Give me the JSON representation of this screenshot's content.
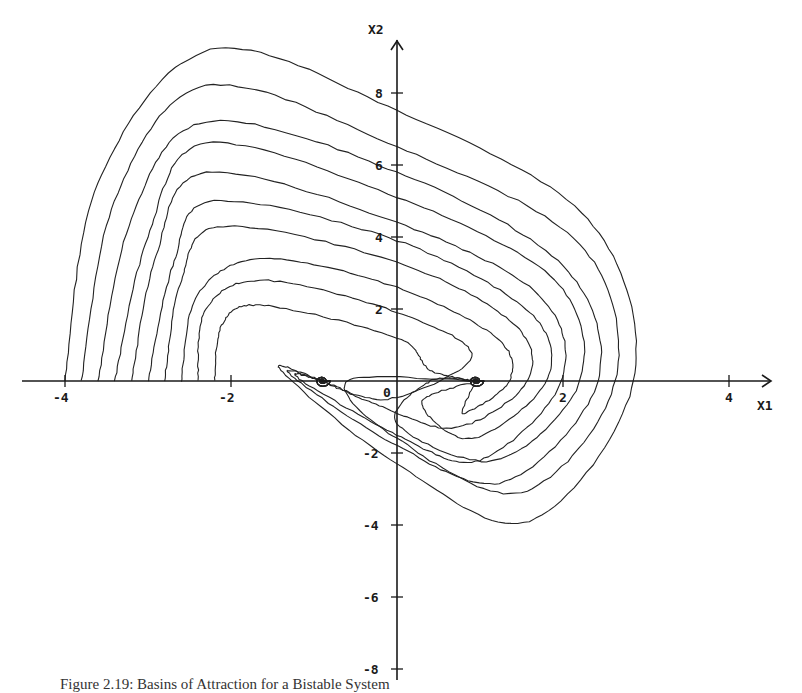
{
  "chart_data": {
    "type": "line",
    "subtype": "phase-portrait",
    "title": "",
    "xlabel": "X1",
    "ylabel": "X2",
    "xlim": [
      -4.8,
      4.6
    ],
    "ylim": [
      -8.3,
      9.6
    ],
    "grid": false,
    "legend": null,
    "x_ticks": [
      -4,
      -2,
      0,
      2,
      4
    ],
    "x_tick_labels": [
      "-4",
      "-2",
      "0",
      "2",
      "4"
    ],
    "y_ticks": [
      -8,
      -6,
      -4,
      -2,
      2,
      4,
      6,
      8
    ],
    "y_tick_labels": [
      "-8",
      "-6",
      "-4",
      "-2",
      "2",
      "4",
      "6",
      "8"
    ],
    "equilibria": [
      {
        "x1": -0.9,
        "x2": 0.0,
        "type": "stable focus"
      },
      {
        "x1": 0.95,
        "x2": 0.0,
        "type": "stable focus"
      }
    ],
    "series": [
      {
        "name": "trajectory 1",
        "x0": -4.0,
        "x2_0": 0.0,
        "points": [
          [
            -4.0,
            0
          ],
          [
            -3.6,
            5.5
          ],
          [
            -2.25,
            9.2
          ],
          [
            0,
            7.5
          ],
          [
            2.3,
            4.5
          ],
          [
            2.85,
            0
          ],
          [
            1.6,
            -3.9
          ],
          [
            0,
            -2.3
          ],
          [
            -1.4,
            0.3
          ],
          [
            -0.9,
            0
          ]
        ]
      },
      {
        "name": "trajectory 2",
        "x0": -3.8,
        "x2_0": 0.0,
        "points": [
          [
            -3.8,
            0
          ],
          [
            -3.4,
            5
          ],
          [
            -2.3,
            8.2
          ],
          [
            0,
            6.5
          ],
          [
            2.2,
            3.8
          ],
          [
            2.63,
            0
          ],
          [
            1.5,
            -3.1
          ],
          [
            0,
            -1.6
          ],
          [
            -0.6,
            0
          ],
          [
            0.95,
            0
          ]
        ]
      },
      {
        "name": "trajectory 3",
        "x0": -3.6,
        "x2_0": 0.0,
        "points": [
          [
            -3.6,
            0
          ],
          [
            -3.2,
            4.5
          ],
          [
            -2.3,
            7.2
          ],
          [
            0,
            5.8
          ],
          [
            2.0,
            3.2
          ],
          [
            2.42,
            0
          ],
          [
            1.3,
            -2.8
          ],
          [
            0,
            -1.8
          ],
          [
            -1.3,
            0.2
          ],
          [
            -0.9,
            0
          ]
        ]
      },
      {
        "name": "trajectory 4",
        "x0": -3.4,
        "x2_0": 0.0,
        "points": [
          [
            -3.4,
            0
          ],
          [
            -3.0,
            4
          ],
          [
            -2.3,
            6.6
          ],
          [
            0,
            5.1
          ],
          [
            1.9,
            2.8
          ],
          [
            2.2,
            0
          ],
          [
            1.2,
            -2.2
          ],
          [
            0,
            -1.2
          ],
          [
            0.4,
            0
          ],
          [
            0.95,
            0
          ]
        ]
      },
      {
        "name": "trajectory 5",
        "x0": -3.2,
        "x2_0": 0.0,
        "points": [
          [
            -3.2,
            0
          ],
          [
            -2.9,
            3.5
          ],
          [
            -2.3,
            5.8
          ],
          [
            0,
            4.4
          ],
          [
            1.7,
            2.4
          ],
          [
            1.98,
            0
          ],
          [
            1.0,
            -2.2
          ],
          [
            0,
            -1.5
          ],
          [
            -1.2,
            0.1
          ],
          [
            -0.9,
            0
          ]
        ]
      },
      {
        "name": "trajectory 6",
        "x0": -3.0,
        "x2_0": 0.0,
        "points": [
          [
            -3.0,
            0
          ],
          [
            -2.7,
            3.2
          ],
          [
            -2.2,
            5.0
          ],
          [
            0,
            3.9
          ],
          [
            1.6,
            1.9
          ],
          [
            1.8,
            0
          ],
          [
            0.9,
            -1.6
          ],
          [
            0.3,
            -0.6
          ],
          [
            0.95,
            0
          ]
        ]
      },
      {
        "name": "trajectory 7",
        "x0": -2.8,
        "x2_0": 0.0,
        "points": [
          [
            -2.8,
            0
          ],
          [
            -2.6,
            2.8
          ],
          [
            -2.1,
            4.3
          ],
          [
            0,
            3.3
          ],
          [
            1.4,
            1.6
          ],
          [
            1.57,
            0
          ],
          [
            0.7,
            -1.3
          ],
          [
            -0.3,
            -0.6
          ],
          [
            -0.9,
            0
          ]
        ]
      },
      {
        "name": "trajectory 8",
        "x0": -2.6,
        "x2_0": 0.0,
        "points": [
          [
            -2.6,
            0
          ],
          [
            -2.4,
            2.4
          ],
          [
            -1.6,
            3.4
          ],
          [
            0,
            2.6
          ],
          [
            1.2,
            1.2
          ],
          [
            1.35,
            0
          ],
          [
            0.8,
            -0.9
          ],
          [
            0.95,
            0
          ]
        ]
      },
      {
        "name": "trajectory 9",
        "x0": -2.4,
        "x2_0": 0.0,
        "points": [
          [
            -2.4,
            0
          ],
          [
            -2.3,
            2
          ],
          [
            -1.6,
            2.8
          ],
          [
            0,
            1.9
          ],
          [
            0.9,
            0.7
          ],
          [
            -0.1,
            -0.5
          ],
          [
            -0.9,
            0
          ]
        ]
      },
      {
        "name": "trajectory 10",
        "x0": -2.2,
        "x2_0": 0.0,
        "points": [
          [
            -2.2,
            0
          ],
          [
            -2.1,
            1.6
          ],
          [
            -1.6,
            2.1
          ],
          [
            0,
            1.2
          ],
          [
            0.4,
            0.3
          ],
          [
            0.95,
            0
          ]
        ]
      }
    ]
  },
  "axes": {
    "x_label": "X1",
    "y_label": "X2",
    "origin_label": "0"
  },
  "caption": "Figure 2.19: Basins of Attraction for a Bistable System"
}
